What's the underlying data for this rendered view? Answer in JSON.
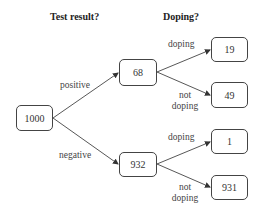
{
  "headers": {
    "test_result": "Test result?",
    "doping": "Doping?"
  },
  "nodes": {
    "root": "1000",
    "positive": "68",
    "negative": "932",
    "pos_doping": "19",
    "pos_not_doping": "49",
    "neg_doping": "1",
    "neg_not_doping": "931"
  },
  "edges": {
    "positive": "positive",
    "negative": "negative",
    "pos_doping": "doping",
    "pos_not_doping_1": "not",
    "pos_not_doping_2": "doping",
    "neg_doping": "doping",
    "neg_not_doping_1": "not",
    "neg_not_doping_2": "doping"
  },
  "colors": {
    "line": "#444444",
    "text": "#333333"
  }
}
